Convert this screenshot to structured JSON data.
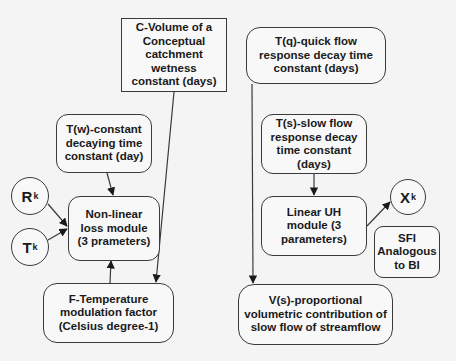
{
  "diagram": {
    "nodes": {
      "c_volume": {
        "label": "C-Volume of a Conceptual catchment wetness constant (days)",
        "shape": "rectangle"
      },
      "t_quick": {
        "label": "T(q)-quick flow response decay time constant (days)",
        "shape": "rounded-rectangle"
      },
      "t_w": {
        "label": "T(w)-constant decaying time constant (day)",
        "shape": "rounded-rectangle"
      },
      "r_k": {
        "main": "R",
        "sub": "k",
        "shape": "circle"
      },
      "t_k": {
        "main": "T",
        "sub": "k",
        "shape": "circle"
      },
      "nonlinear_loss": {
        "label": "Non-linear loss module (3 prameters)",
        "shape": "rounded-rectangle"
      },
      "t_slow": {
        "label": "T(s)-slow flow response decay time constant (days)",
        "shape": "rounded-rectangle"
      },
      "linear_uh": {
        "label": "Linear UH module (3 parameters)",
        "shape": "rounded-rectangle"
      },
      "x_k": {
        "main": "X",
        "sub": "k",
        "shape": "circle"
      },
      "sfi": {
        "label": "SFI Analogous to BI",
        "shape": "rounded-rectangle"
      },
      "f_temp": {
        "label": "F-Temperature modulation factor (Celsius degree-1)",
        "shape": "rounded-rectangle"
      },
      "v_slow": {
        "label": "V(s)-proportional volumetric contribution of slow flow of streamflow",
        "shape": "rounded-rectangle"
      }
    },
    "edges": [
      {
        "from": "t_w",
        "to": "nonlinear_loss"
      },
      {
        "from": "r_k",
        "to": "nonlinear_loss"
      },
      {
        "from": "t_k",
        "to": "nonlinear_loss"
      },
      {
        "from": "f_temp",
        "to": "nonlinear_loss"
      },
      {
        "from": "c_volume",
        "to": "f_temp"
      },
      {
        "from": "t_quick",
        "to": "v_slow"
      },
      {
        "from": "t_slow",
        "to": "linear_uh"
      },
      {
        "from": "linear_uh",
        "to": "x_k"
      }
    ],
    "colors": {
      "stroke": "#3a3a3a",
      "fill": "#f8f8f8",
      "background": "#f4f4f4",
      "text": "#1a1a1a"
    }
  }
}
